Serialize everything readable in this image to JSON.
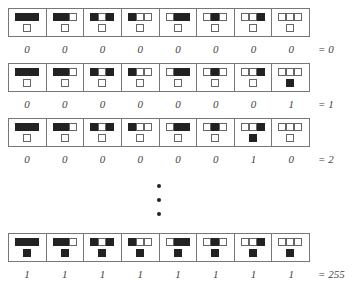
{
  "neighborhoods": [
    "111",
    "110",
    "101",
    "100",
    "011",
    "010",
    "001",
    "000"
  ],
  "rows": [
    {
      "outputs": [
        0,
        0,
        0,
        0,
        0,
        0,
        0,
        0
      ],
      "labels": [
        "0",
        "0",
        "0",
        "0",
        "0",
        "0",
        "0",
        "0"
      ],
      "result": "= 0",
      "top": 8
    },
    {
      "outputs": [
        0,
        0,
        0,
        0,
        0,
        0,
        0,
        1
      ],
      "labels": [
        "0",
        "0",
        "0",
        "0",
        "0",
        "0",
        "0",
        "1"
      ],
      "result": "= 1",
      "top": 63
    },
    {
      "outputs": [
        0,
        0,
        0,
        0,
        0,
        0,
        1,
        0
      ],
      "labels": [
        "0",
        "0",
        "0",
        "0",
        "0",
        "0",
        "1",
        "0"
      ],
      "result": "= 2",
      "top": 118
    },
    {
      "outputs": [
        1,
        1,
        1,
        1,
        1,
        1,
        1,
        1
      ],
      "labels": [
        "1",
        "1",
        "1",
        "1",
        "1",
        "1",
        "1",
        "1"
      ],
      "result": "= 255",
      "top": 233
    }
  ],
  "ellipsis": "vertical-dots"
}
